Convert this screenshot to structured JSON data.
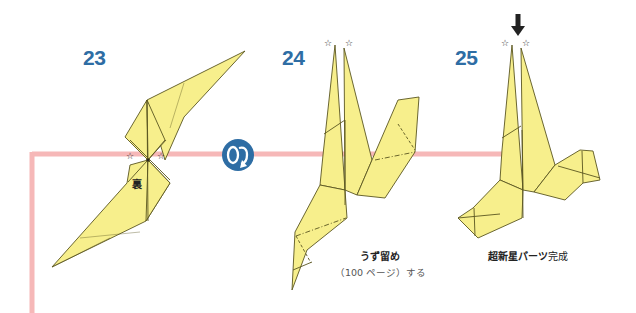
{
  "diagram": {
    "colors": {
      "paper_fill": "#f7ef8c",
      "paper_stroke": "#5a5620",
      "guide_line": "#f6b8b8",
      "step_number": "#2e6da4",
      "turn_over_badge": "#2e6da4"
    },
    "steps": [
      {
        "number": "23",
        "marker_label": "裏",
        "notes": []
      },
      {
        "number": "24",
        "caption_main": "うず留め",
        "caption_sub": "（100 ページ）する"
      },
      {
        "number": "25",
        "caption_main": "超新星パーツ",
        "caption_tail": "完成"
      }
    ],
    "turn_over_icon": "turn-over-icon",
    "star_marker": "☆",
    "arrow_down": "⬇"
  }
}
